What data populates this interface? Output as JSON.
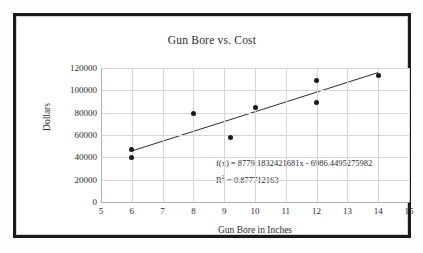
{
  "figure": {
    "ylabel": "Dollars",
    "xlabel": "Gun Bore in Inches"
  },
  "annotations": {
    "equation_prefix": "f(x) = ",
    "equation": "f(x) = 8779.1832421681x - 6986.4495275982",
    "r2_prefix": "R",
    "r2_sup": "2",
    "r2_value": " = 0.877712163",
    "r2": "R² = 0.877712163"
  },
  "chart_data": {
    "type": "scatter",
    "title": "Gun Bore vs. Cost",
    "xlabel": "Gun Bore in Inches",
    "ylabel": "Dollars",
    "xlim": [
      5,
      15
    ],
    "ylim": [
      0,
      120000
    ],
    "xticks": [
      5,
      6,
      7,
      8,
      9,
      10,
      11,
      12,
      13,
      14,
      15
    ],
    "yticks": [
      0,
      20000,
      40000,
      60000,
      80000,
      100000,
      120000
    ],
    "ytick_labels": [
      "0",
      "20000",
      "40000",
      "60000",
      "80000",
      "100000",
      "120000"
    ],
    "xtick_labels": [
      "5",
      "6",
      "7",
      "8",
      "9",
      "10",
      "11",
      "12",
      "13",
      "14",
      "15"
    ],
    "grid": true,
    "legend": false,
    "marker_color": "#1a1a1a",
    "trendline_color": "#2b2b2b",
    "grid_color": "#d6d6d6",
    "points": [
      {
        "x": 6,
        "y": 47000
      },
      {
        "x": 6,
        "y": 40000
      },
      {
        "x": 8,
        "y": 79000
      },
      {
        "x": 9.2,
        "y": 58000
      },
      {
        "x": 10,
        "y": 85000
      },
      {
        "x": 12,
        "y": 108500
      },
      {
        "x": 12,
        "y": 89500
      },
      {
        "x": 14,
        "y": 113500
      }
    ],
    "trendline": {
      "slope": 8779.1832421681,
      "intercept": -6986.4495275982,
      "r_squared": 0.877712163,
      "x_start": 6,
      "x_end": 14,
      "y_start": 45689.65,
      "y_end": 115923.11
    }
  }
}
